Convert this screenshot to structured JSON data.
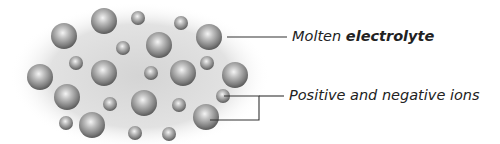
{
  "diagram": {
    "title": "Molten electrolyte",
    "labels": {
      "electrolyte": {
        "prefix": "Molten",
        "bold": "electrolyte"
      },
      "ions": "Positive and negative ions"
    },
    "colors": {
      "sphere_light": "#f2f2f2",
      "sphere_mid": "#a8a8a8",
      "sphere_dark": "#5a5a5a",
      "haze": "#dcdcdc",
      "line": "#333333",
      "text": "#222222"
    },
    "ions_large": [
      {
        "cx": 64,
        "cy": 36,
        "r": 13
      },
      {
        "cx": 104,
        "cy": 21,
        "r": 13
      },
      {
        "cx": 159,
        "cy": 45,
        "r": 13
      },
      {
        "cx": 209,
        "cy": 37,
        "r": 13
      },
      {
        "cx": 40,
        "cy": 77,
        "r": 13
      },
      {
        "cx": 104,
        "cy": 73,
        "r": 13
      },
      {
        "cx": 183,
        "cy": 73,
        "r": 13
      },
      {
        "cx": 235,
        "cy": 75,
        "r": 13
      },
      {
        "cx": 67,
        "cy": 97,
        "r": 13
      },
      {
        "cx": 144,
        "cy": 103,
        "r": 13
      },
      {
        "cx": 92,
        "cy": 125,
        "r": 13
      },
      {
        "cx": 206,
        "cy": 117,
        "r": 13
      }
    ],
    "ions_small": [
      {
        "cx": 138,
        "cy": 18,
        "r": 7
      },
      {
        "cx": 181,
        "cy": 23,
        "r": 7
      },
      {
        "cx": 123,
        "cy": 48,
        "r": 7
      },
      {
        "cx": 76,
        "cy": 63,
        "r": 7
      },
      {
        "cx": 151,
        "cy": 73,
        "r": 7
      },
      {
        "cx": 207,
        "cy": 63,
        "r": 7
      },
      {
        "cx": 110,
        "cy": 104,
        "r": 7
      },
      {
        "cx": 179,
        "cy": 105,
        "r": 7
      },
      {
        "cx": 223,
        "cy": 96,
        "r": 7
      },
      {
        "cx": 66,
        "cy": 123,
        "r": 7
      },
      {
        "cx": 135,
        "cy": 133,
        "r": 7
      },
      {
        "cx": 169,
        "cy": 134,
        "r": 7
      }
    ]
  }
}
